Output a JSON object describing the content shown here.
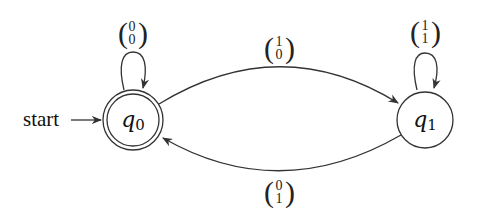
{
  "diagram": {
    "type": "finite-automaton",
    "start_label": "start",
    "states": [
      {
        "id": "q0",
        "name": "q",
        "subscript": "0",
        "accepting": true,
        "start": true
      },
      {
        "id": "q1",
        "name": "q",
        "subscript": "1",
        "accepting": false,
        "start": false
      }
    ],
    "transitions": [
      {
        "from": "q0",
        "to": "q0",
        "label": {
          "top": "0",
          "bottom": "0"
        }
      },
      {
        "from": "q0",
        "to": "q1",
        "label": {
          "top": "1",
          "bottom": "0"
        }
      },
      {
        "from": "q1",
        "to": "q1",
        "label": {
          "top": "1",
          "bottom": "1"
        }
      },
      {
        "from": "q1",
        "to": "q0",
        "label": {
          "top": "0",
          "bottom": "1"
        }
      }
    ]
  },
  "colors": {
    "stroke": "#333333",
    "text": "#111111",
    "background": "#ffffff"
  }
}
